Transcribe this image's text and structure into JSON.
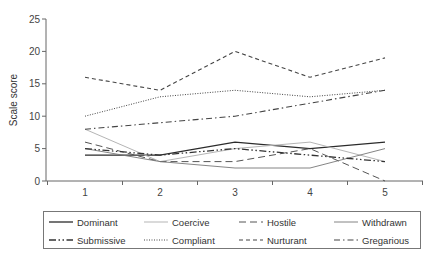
{
  "chart_data": {
    "type": "line",
    "title": "",
    "xlabel": "",
    "ylabel": "Scale score",
    "x": [
      1,
      2,
      3,
      4,
      5
    ],
    "ylim": [
      0,
      25
    ],
    "yticks": [
      0,
      5,
      10,
      15,
      20,
      25
    ],
    "grid": false,
    "legend_position": "bottom",
    "series": [
      {
        "name": "Dominant",
        "values": [
          4,
          4,
          6,
          5,
          6
        ],
        "style": "solid",
        "color": "#2b2b2b",
        "width": 1.3
      },
      {
        "name": "Coercive",
        "values": [
          8,
          3,
          5,
          6,
          3
        ],
        "style": "solid",
        "color": "#b5b5b5",
        "width": 1.0
      },
      {
        "name": "Hostile",
        "values": [
          6,
          3,
          3,
          5,
          0
        ],
        "style": "longdash",
        "color": "#555555",
        "width": 1.0
      },
      {
        "name": "Withdrawn",
        "values": [
          5,
          3,
          2,
          2,
          5
        ],
        "style": "solid",
        "color": "#777777",
        "width": 0.9
      },
      {
        "name": "Submissive",
        "values": [
          5,
          4,
          5,
          4,
          3
        ],
        "style": "dashdotdot",
        "color": "#333333",
        "width": 1.3
      },
      {
        "name": "Compliant",
        "values": [
          10,
          13,
          14,
          13,
          14
        ],
        "style": "dotted",
        "color": "#444444",
        "width": 1.0
      },
      {
        "name": "Nurturant",
        "values": [
          16,
          14,
          20,
          16,
          19
        ],
        "style": "dashed",
        "color": "#444444",
        "width": 1.1
      },
      {
        "name": "Gregarious",
        "values": [
          8,
          9,
          10,
          12,
          14
        ],
        "style": "dashdot",
        "color": "#444444",
        "width": 1.1
      }
    ]
  },
  "axis": {
    "ylabel": "Scale score",
    "y_tick_labels": [
      "0",
      "5",
      "10",
      "15",
      "20",
      "25"
    ],
    "x_tick_labels": [
      "1",
      "2",
      "3",
      "4",
      "5"
    ]
  },
  "legend": {
    "items": [
      {
        "label": "Dominant"
      },
      {
        "label": "Coercive"
      },
      {
        "label": "Hostile"
      },
      {
        "label": "Withdrawn"
      },
      {
        "label": "Submissive"
      },
      {
        "label": "Compliant"
      },
      {
        "label": "Nurturant"
      },
      {
        "label": "Gregarious"
      }
    ]
  }
}
